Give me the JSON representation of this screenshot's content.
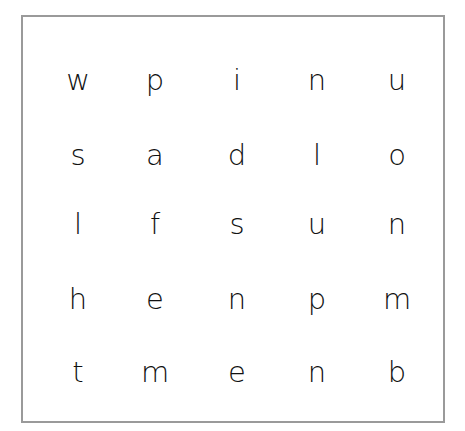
{
  "puzzle": {
    "type": "word-search",
    "rows": 5,
    "cols": 5,
    "grid": [
      [
        "w",
        "p",
        "i",
        "n",
        "u"
      ],
      [
        "s",
        "a",
        "d",
        "l",
        "o"
      ],
      [
        "l",
        "f",
        "s",
        "u",
        "n"
      ],
      [
        "h",
        "e",
        "n",
        "p",
        "m"
      ],
      [
        "t",
        "m",
        "e",
        "n",
        "b"
      ]
    ]
  },
  "colors": {
    "border": "#9a9a9a",
    "text": "#111111",
    "background": "#ffffff"
  }
}
